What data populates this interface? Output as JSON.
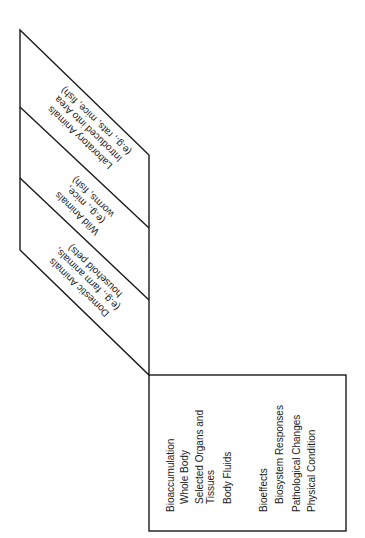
{
  "diagram": {
    "stroke_color": "#1a1a1a",
    "background": "#ffffff",
    "parallelogram": {
      "label": "Animal categories",
      "sections": [
        {
          "id": "laboratory",
          "lines": [
            "Laboratory Animals",
            "Introduced into Area",
            "(e.g., rats, mice, fish)"
          ]
        },
        {
          "id": "wild",
          "lines": [
            "Wild Animals",
            "(e.g., mice,",
            "worms, fish)"
          ]
        },
        {
          "id": "domestic",
          "lines": [
            "Domestic Animals",
            "(e.g., farm animals,",
            "household pets)"
          ]
        }
      ]
    },
    "measurements_box": {
      "groups": [
        {
          "heading": "Bioaccumulation",
          "items": [
            "Whole Body",
            "Selected Organs and",
            "Tissues",
            "Body Fluids"
          ]
        },
        {
          "heading": "Bioeffects",
          "items": [
            "Biosystem Responses",
            "Pathological Changes",
            "Physical Condition"
          ]
        }
      ]
    }
  }
}
